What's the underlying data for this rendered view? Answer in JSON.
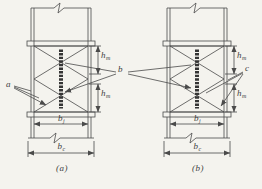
{
  "figure_type": "engineering-diagram",
  "colors": {
    "paper": "#f4f3ee",
    "ink": "#4a4a4a",
    "stiffener": "#353535",
    "text": "#3e3e3e"
  },
  "labels": {
    "callout_a": "a",
    "callout_b": "b",
    "callout_c": "c",
    "dim_h_base": "h",
    "dim_h_sub": "m",
    "dim_bj_base": "b",
    "dim_bj_sub": "j",
    "dim_bc_base": "b",
    "dim_bc_sub": "c",
    "caption_a": "(a)",
    "caption_b": "(b)"
  },
  "dimensions": {
    "panel_a": {
      "height_upper": "hm",
      "height_lower": "hm",
      "inner_width": "bj",
      "outer_width": "bc"
    },
    "panel_b": {
      "height_upper": "hm",
      "height_lower": "hm",
      "inner_width": "bj",
      "outer_width": "bc"
    }
  }
}
